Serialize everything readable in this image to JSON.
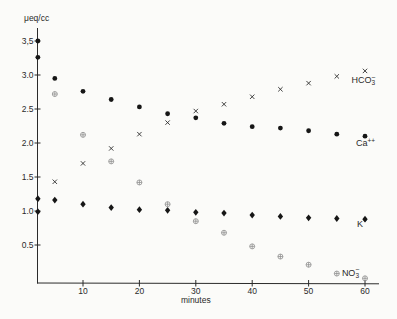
{
  "chart_data": {
    "type": "scatter",
    "title": "",
    "ylabel": "μeq/cc",
    "xlabel": "minutes",
    "grid": false,
    "legend_position": "inline-right-of-each-series",
    "xlim": [
      0,
      62.5
    ],
    "ylim": [
      0,
      3.73
    ],
    "x_ticks": [
      10,
      20,
      30,
      40,
      50,
      60
    ],
    "y_ticks": [
      0.5,
      1.0,
      1.5,
      2.0,
      2.5,
      3.0,
      3.5
    ],
    "y_tick_labels": [
      "0.5",
      "1.0",
      "1.5",
      "2.0",
      "2.5",
      "3.0",
      "3,5"
    ],
    "series": [
      {
        "name": "Ca++",
        "marker": "filled-circle",
        "color": "#161616",
        "label_segments": [
          {
            "txt": "Ca"
          },
          {
            "txt": "++",
            "pos": "sup"
          }
        ],
        "label_at": [
          58.4,
          1.95
        ],
        "points": [
          [
            2,
            3.5
          ],
          [
            2,
            3.26
          ],
          [
            5,
            2.95
          ],
          [
            10,
            2.76
          ],
          [
            15,
            2.64
          ],
          [
            20,
            2.53
          ],
          [
            25,
            2.43
          ],
          [
            30,
            2.37
          ],
          [
            35,
            2.29
          ],
          [
            40,
            2.24
          ],
          [
            45,
            2.22
          ],
          [
            50,
            2.18
          ],
          [
            55,
            2.13
          ],
          [
            60,
            2.1
          ]
        ]
      },
      {
        "name": "HCO3-",
        "marker": "x-cross",
        "color": "#2e2e2e",
        "label_segments": [
          {
            "txt": "HCO"
          },
          {
            "txt": "3",
            "pos": "sub"
          },
          {
            "txt": "−",
            "pos": "over"
          }
        ],
        "label_at": [
          57.6,
          2.88
        ],
        "points": [
          [
            5,
            1.43
          ],
          [
            10,
            1.7
          ],
          [
            15,
            1.92
          ],
          [
            20,
            2.13
          ],
          [
            25,
            2.3
          ],
          [
            30,
            2.47
          ],
          [
            35,
            2.57
          ],
          [
            40,
            2.68
          ],
          [
            45,
            2.79
          ],
          [
            50,
            2.88
          ],
          [
            55,
            2.98
          ],
          [
            60,
            3.06
          ]
        ]
      },
      {
        "name": "K+",
        "marker": "filled-diamond",
        "color": "#161616",
        "label_segments": [
          {
            "txt": "K"
          },
          {
            "txt": "+",
            "pos": "sup"
          }
        ],
        "label_at": [
          58.6,
          0.77
        ],
        "points": [
          [
            2,
            1.18
          ],
          [
            2,
            0.99
          ],
          [
            5,
            1.16
          ],
          [
            10,
            1.1
          ],
          [
            15,
            1.05
          ],
          [
            20,
            1.02
          ],
          [
            25,
            1.01
          ],
          [
            30,
            0.98
          ],
          [
            35,
            0.97
          ],
          [
            40,
            0.94
          ],
          [
            45,
            0.92
          ],
          [
            50,
            0.9
          ],
          [
            55,
            0.89
          ],
          [
            60,
            0.88
          ]
        ]
      },
      {
        "name": "NO3-",
        "marker": "circle-plus",
        "color": "#8e8e8e",
        "label_segments": [
          {
            "txt": "NO"
          },
          {
            "txt": "3",
            "pos": "sub"
          },
          {
            "txt": "−",
            "pos": "over"
          }
        ],
        "label_at": [
          55.9,
          0.05
        ],
        "points": [
          [
            5,
            2.72
          ],
          [
            10,
            2.12
          ],
          [
            15,
            1.73
          ],
          [
            20,
            1.42
          ],
          [
            25,
            1.1
          ],
          [
            30,
            0.85
          ],
          [
            35,
            0.68
          ],
          [
            40,
            0.48
          ],
          [
            45,
            0.33
          ],
          [
            50,
            0.21
          ],
          [
            55,
            0.08
          ],
          [
            60,
            0.01
          ]
        ]
      }
    ]
  }
}
